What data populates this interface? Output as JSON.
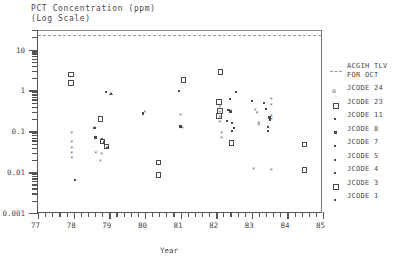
{
  "chart_data": {
    "type": "scatter",
    "title": "PCT Concentration (ppm)",
    "subtitle": "(Log Scale)",
    "xlabel": "Year",
    "ylabel": "",
    "xlim": [
      77,
      85
    ],
    "ylim": [
      0.001,
      30
    ],
    "yscale": "log",
    "grid": false,
    "xticks": [
      "77",
      "78",
      "79",
      "80",
      "81",
      "82",
      "83",
      "84",
      "85"
    ],
    "yticks": [
      "10",
      "1",
      "0.1",
      "0.01",
      "0.001"
    ],
    "legend_position": "right",
    "annotations": [
      {
        "name": "acgih-tlv-line",
        "label": "ACGIH TLV FOR OCT",
        "type": "hline",
        "y": 20,
        "style": "dashed"
      }
    ],
    "series": [
      {
        "name": "ACGIH TLV FOR OCT",
        "marker": "dashed-line",
        "points": []
      },
      {
        "name": "JCODE 24",
        "marker": "x",
        "points": [
          [
            77.95,
            0.09
          ],
          [
            77.95,
            0.055
          ],
          [
            77.95,
            0.04
          ],
          [
            77.95,
            0.03
          ],
          [
            77.95,
            0.022
          ],
          [
            78.6,
            0.12
          ],
          [
            78.62,
            0.03
          ],
          [
            78.78,
            0.028
          ],
          [
            78.75,
            0.019
          ],
          [
            80.0,
            0.3
          ],
          [
            81.0,
            0.25
          ],
          [
            81.05,
            0.12
          ],
          [
            82.1,
            0.4
          ],
          [
            82.1,
            0.3
          ],
          [
            82.1,
            0.22
          ],
          [
            82.1,
            0.17
          ],
          [
            82.15,
            0.09
          ],
          [
            82.15,
            0.07
          ],
          [
            83.1,
            0.33
          ],
          [
            83.15,
            0.28
          ],
          [
            83.2,
            0.16
          ],
          [
            83.2,
            0.14
          ],
          [
            83.55,
            0.6
          ],
          [
            83.55,
            0.45
          ],
          [
            83.55,
            0.23
          ],
          [
            83.55,
            0.2
          ],
          [
            83.05,
            0.012
          ],
          [
            83.55,
            0.011
          ]
        ]
      },
      {
        "name": "JCODE 23",
        "marker": "open-square",
        "points": [
          [
            77.9,
            2.6
          ],
          [
            77.9,
            1.6
          ],
          [
            78.72,
            0.21
          ],
          [
            78.78,
            0.06
          ],
          [
            80.35,
            0.018
          ],
          [
            80.35,
            0.009
          ],
          [
            82.1,
            3.0
          ],
          [
            82.05,
            0.55
          ],
          [
            82.08,
            0.33
          ],
          [
            82.05,
            0.25
          ],
          [
            84.45,
            0.05
          ],
          [
            84.45,
            0.012
          ],
          [
            81.05,
            1.9
          ]
        ]
      },
      {
        "name": "JCODE 11",
        "marker": "dot",
        "points": [
          [
            78.9,
            0.9
          ],
          [
            80.95,
            0.95
          ],
          [
            82.4,
            0.62
          ],
          [
            82.55,
            0.9
          ],
          [
            83.0,
            0.55
          ],
          [
            83.35,
            0.5
          ],
          [
            83.4,
            0.35
          ]
        ]
      },
      {
        "name": "JCODE 8",
        "marker": "small-square",
        "points": [
          [
            78.58,
            0.12
          ],
          [
            78.62,
            0.07
          ],
          [
            79.95,
            0.27
          ],
          [
            81.0,
            0.13
          ],
          [
            82.35,
            0.33
          ],
          [
            82.4,
            0.3
          ],
          [
            83.5,
            0.22
          ]
        ]
      },
      {
        "name": "JCODE 7",
        "marker": "dot",
        "points": [
          [
            78.8,
            0.065
          ],
          [
            82.3,
            0.18
          ],
          [
            82.45,
            0.16
          ],
          [
            83.5,
            0.19
          ]
        ]
      },
      {
        "name": "JCODE 5",
        "marker": "dot",
        "points": [
          [
            78.85,
            0.055
          ],
          [
            82.5,
            0.12
          ],
          [
            83.45,
            0.13
          ]
        ]
      },
      {
        "name": "JCODE 4",
        "marker": "dot",
        "points": [
          [
            78.05,
            0.0065
          ],
          [
            82.45,
            0.1
          ],
          [
            83.45,
            0.1
          ]
        ]
      },
      {
        "name": "JCODE 3",
        "marker": "open-square",
        "points": [
          [
            78.9,
            0.045
          ],
          [
            82.4,
            0.055
          ]
        ]
      },
      {
        "name": "JCODE 1",
        "marker": "triangle",
        "points": [
          [
            78.95,
            0.04
          ],
          [
            79.05,
            0.85
          ]
        ]
      }
    ]
  },
  "legend": {
    "items": [
      {
        "label": "ACGIH TLV",
        "label2": "FOR OCT",
        "symbol": "dashed-line"
      },
      {
        "label": "JCODE 24",
        "symbol": "x"
      },
      {
        "label": "JCODE 23",
        "symbol": "open-square"
      },
      {
        "label": "JCODE 11",
        "symbol": "dot"
      },
      {
        "label": "JCODE 8",
        "symbol": "small-square"
      },
      {
        "label": "JCODE 7",
        "symbol": "dot"
      },
      {
        "label": "JCODE 5",
        "symbol": "dot"
      },
      {
        "label": "JCODE 4",
        "symbol": "dot"
      },
      {
        "label": "JCODE 3",
        "symbol": "open-square"
      },
      {
        "label": "JCODE 1",
        "symbol": "dot"
      }
    ]
  }
}
